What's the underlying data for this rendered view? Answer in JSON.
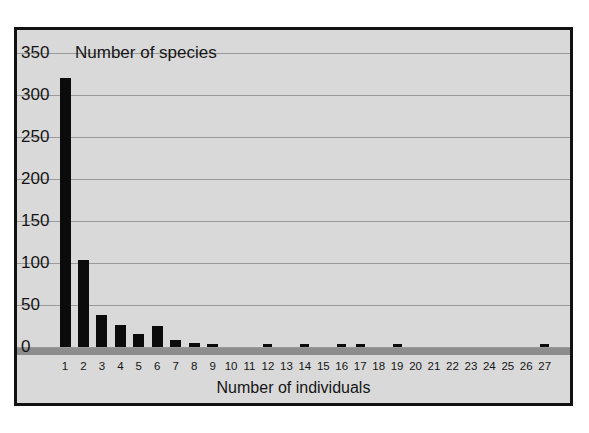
{
  "chart_data": {
    "type": "bar",
    "title": "Number of species",
    "xlabel": "Number of individuals",
    "ylabel": "Number of species",
    "categories": [
      "1",
      "2",
      "3",
      "4",
      "5",
      "6",
      "7",
      "8",
      "9",
      "10",
      "11",
      "12",
      "13",
      "14",
      "15",
      "16",
      "17",
      "18",
      "19",
      "20",
      "21",
      "22",
      "23",
      "24",
      "25",
      "26",
      "27"
    ],
    "values": [
      320,
      103,
      38,
      26,
      15,
      25,
      8,
      5,
      3,
      0,
      0,
      3,
      0,
      3,
      0,
      3,
      3,
      0,
      3,
      0,
      0,
      0,
      0,
      0,
      0,
      0,
      3
    ],
    "ylim": [
      0,
      350
    ],
    "yticks": [
      0,
      50,
      100,
      150,
      200,
      250,
      300,
      350
    ],
    "ytick_labels": [
      "0",
      "50",
      "100",
      "150",
      "200",
      "250",
      "300",
      "350"
    ],
    "grid": true,
    "legend": false,
    "colors": {
      "bar": "#0b0b0b",
      "plot_background": "#d9d9d9",
      "gridline": "#9a9a9a",
      "baseline": "#8d8d8d",
      "frame": "#111111",
      "text": "#151515"
    }
  }
}
